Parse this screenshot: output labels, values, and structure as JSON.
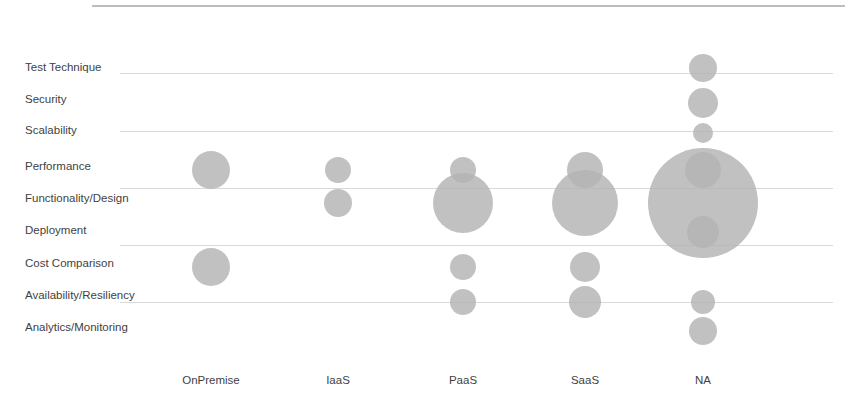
{
  "chart_data": {
    "type": "scatter",
    "subtype": "bubble",
    "title": "",
    "xlabel": "",
    "ylabel": "",
    "grid": true,
    "legend": false,
    "categories": [
      "OnPremise",
      "IaaS",
      "PaaS",
      "SaaS",
      "NA"
    ],
    "y_categories": [
      "Test Technique",
      "Security",
      "Scalability",
      "Performance",
      "Functionality/Design",
      "Deployment",
      "Cost Comparison",
      "Availability/Resiliency",
      "Analytics/Monitoring"
    ],
    "bubble_color": "#b3b3b3",
    "grid_color": "#d9d9d9",
    "points": [
      {
        "x": "OnPremise",
        "y": "Performance",
        "r": 19,
        "value": 4
      },
      {
        "x": "OnPremise",
        "y": "Cost Comparison",
        "r": 19,
        "value": 4
      },
      {
        "x": "IaaS",
        "y": "Performance",
        "r": 13,
        "value": 2
      },
      {
        "x": "IaaS",
        "y": "Functionality/Design",
        "r": 14,
        "value": 2
      },
      {
        "x": "PaaS",
        "y": "Performance",
        "r": 13,
        "value": 2
      },
      {
        "x": "PaaS",
        "y": "Functionality/Design",
        "r": 30,
        "value": 10
      },
      {
        "x": "PaaS",
        "y": "Cost Comparison",
        "r": 13,
        "value": 2
      },
      {
        "x": "PaaS",
        "y": "Availability/Resiliency",
        "r": 13,
        "value": 2
      },
      {
        "x": "SaaS",
        "y": "Performance",
        "r": 18,
        "value": 3
      },
      {
        "x": "SaaS",
        "y": "Functionality/Design",
        "r": 33,
        "value": 12
      },
      {
        "x": "SaaS",
        "y": "Cost Comparison",
        "r": 15,
        "value": 3
      },
      {
        "x": "SaaS",
        "y": "Availability/Resiliency",
        "r": 16,
        "value": 3
      },
      {
        "x": "NA",
        "y": "Test Technique",
        "r": 14,
        "value": 2
      },
      {
        "x": "NA",
        "y": "Security",
        "r": 15,
        "value": 2
      },
      {
        "x": "NA",
        "y": "Scalability",
        "r": 10,
        "value": 1
      },
      {
        "x": "NA",
        "y": "Performance",
        "r": 18,
        "value": 3
      },
      {
        "x": "NA",
        "y": "Functionality/Design",
        "r": 55,
        "value": 30
      },
      {
        "x": "NA",
        "y": "Deployment",
        "r": 16,
        "value": 3
      },
      {
        "x": "NA",
        "y": "Availability/Resiliency",
        "r": 12,
        "value": 2
      },
      {
        "x": "NA",
        "y": "Analytics/Monitoring",
        "r": 14,
        "value": 2
      }
    ]
  },
  "geometry": {
    "top_rule_y": 6,
    "top_rule_x1": 92,
    "top_rule_x2": 845,
    "grid_x1": 120,
    "grid_x2": 833,
    "grid_y": [
      73,
      131,
      188,
      245,
      302
    ],
    "y_label_x": 25,
    "y_label_y": [
      68,
      100,
      131,
      167,
      199,
      231,
      264,
      296,
      328
    ],
    "x_label_y": 381,
    "x_label_cx": [
      211,
      338,
      463,
      585,
      703
    ],
    "column_cx": {
      "OnPremise": 211,
      "IaaS": 338,
      "PaaS": 463,
      "SaaS": 585,
      "NA": 703
    },
    "row_cy": {
      "Test Technique": 68,
      "Security": 103,
      "Scalability": 133,
      "Performance": 170,
      "Functionality/Design": 203,
      "Deployment": 232,
      "Cost Comparison": 267,
      "Availability/Resiliency": 302,
      "Analytics/Monitoring": 331
    }
  }
}
